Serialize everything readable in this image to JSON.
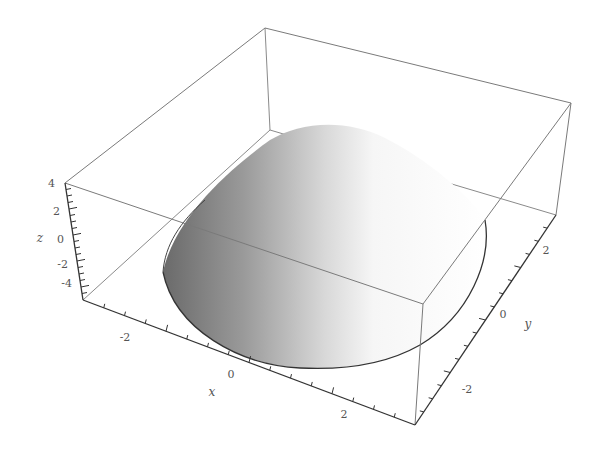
{
  "chart_data": {
    "type": "surface3d",
    "title": "",
    "axes": {
      "x": {
        "label": "x",
        "ticks": [
          "-2",
          "0",
          "2"
        ],
        "range": [
          -4,
          4
        ]
      },
      "y": {
        "label": "y",
        "ticks": [
          "-2",
          "0",
          "2"
        ],
        "range": [
          -4,
          4
        ]
      },
      "z": {
        "label": "z",
        "ticks": [
          "4",
          "2",
          "0",
          "-2",
          "-4"
        ],
        "range": [
          -5,
          4
        ]
      }
    },
    "surface": {
      "shape": "dome",
      "domain": "disk of radius ~3 centered at origin",
      "max_z": 4,
      "boundary_z": -5,
      "shading": "grayscale, dark on left to white on right"
    },
    "box": true,
    "grid": false,
    "legend": null
  },
  "colors": {
    "box_edge": "#7a7a7a",
    "axis_edge": "#333333",
    "surface_dark": "#6e6e6e",
    "surface_light": "#ffffff",
    "label": "#555555"
  }
}
